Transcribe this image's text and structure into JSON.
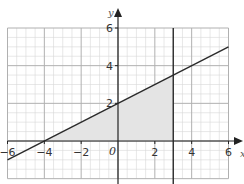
{
  "chart_data": {
    "type": "line",
    "title": "",
    "xlabel": "x",
    "ylabel": "y",
    "origin_label": "0",
    "xlim": [
      -6,
      6
    ],
    "ylim": [
      -2,
      6
    ],
    "grid": {
      "major_step": 2,
      "minor_step": 0.5,
      "on": true
    },
    "x_ticks": [
      -6,
      -4,
      -2,
      2,
      4,
      6
    ],
    "x_tick_labels": [
      "−6",
      "−4",
      "−2",
      "2",
      "4",
      "6"
    ],
    "y_ticks": [
      2,
      4,
      6
    ],
    "y_tick_labels": [
      "2",
      "4",
      "6"
    ],
    "series": [
      {
        "name": "y = 0.5x + 2",
        "x": [
          -6,
          6
        ],
        "y": [
          -1,
          5
        ]
      },
      {
        "name": "x = 3",
        "x": [
          3,
          3
        ],
        "y": [
          -2,
          6
        ]
      }
    ],
    "shaded_region": {
      "vertices": [
        [
          -4,
          0
        ],
        [
          3,
          0
        ],
        [
          3,
          3.5
        ]
      ],
      "description": "Region bounded by y = 0.5x + 2, x = 3 and the x-axis"
    }
  },
  "colors": {
    "line": "#2a2a2a",
    "shade": "#e4e4e4",
    "minor_grid": "#d8d8d8",
    "major_grid": "#b0b0b0",
    "axis": "#222222"
  }
}
